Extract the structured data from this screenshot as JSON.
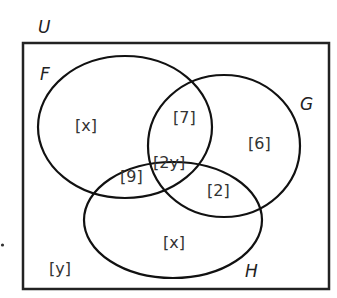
{
  "diagram": {
    "type": "venn",
    "universal_set": {
      "label": "U"
    },
    "sets": [
      {
        "label": "F"
      },
      {
        "label": "G"
      },
      {
        "label": "H"
      }
    ],
    "regions": {
      "F_only": "[x]",
      "F_and_G_only": "[7]",
      "G_only": "[6]",
      "F_and_H_only": "[9]",
      "F_G_H": "[2y]",
      "G_and_H_only": "[2]",
      "H_only": "[x]",
      "outside": "[y]"
    },
    "colors": {
      "stroke": "#111111",
      "text": "#333333",
      "background": "#ffffff"
    }
  }
}
